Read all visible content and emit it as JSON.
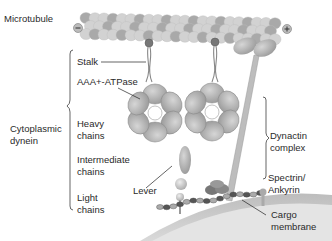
{
  "diagram": {
    "labels": {
      "microtubule": "Microtubule",
      "minus_end": "−",
      "plus_end": "+",
      "stalk": "Stalk",
      "aaa_atpase": "AAA+-ATPase",
      "cytoplasmic_dynein": "Cytoplasmic\ndynein",
      "heavy_chains": "Heavy\nchains",
      "intermediate_chains": "Intermediate\nchains",
      "light_chains": "Light\nchains",
      "lever": "Lever",
      "dynactin_complex": "Dynactin\ncomplex",
      "spectrin_ankyrin": "Spectrin/\nAnkyrin",
      "cargo_membrane": "Cargo\nmembrane"
    },
    "colors": {
      "text": "#2a2a2a",
      "microtubule_light": "#d4d4d4",
      "microtubule_dark": "#a9a9a9",
      "protein": "#b5b5b5",
      "protein_dark": "#8a8a8a",
      "membrane": "#c7c7c7",
      "membrane_inner": "#e3e3e3",
      "leader_line": "#222222"
    }
  }
}
